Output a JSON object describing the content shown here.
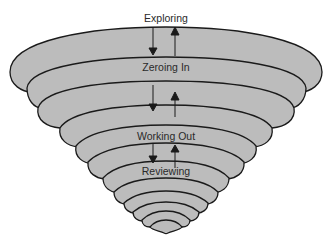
{
  "diagram": {
    "type": "funnel-vortex",
    "colors": {
      "fill": "#bcbcbc",
      "stroke": "#1a1a1a",
      "background": "#ffffff"
    },
    "stages": [
      {
        "label": "Exploring",
        "x": 166,
        "y": 13
      },
      {
        "label": "Zeroing In",
        "x": 166,
        "y": 62
      },
      {
        "label": "Working Out",
        "x": 166,
        "y": 129
      },
      {
        "label": "Reviewing",
        "x": 166,
        "y": 165
      }
    ],
    "arrows": [
      {
        "direction": "down",
        "x": 153,
        "y1": 27,
        "y2": 55
      },
      {
        "direction": "up",
        "x": 175,
        "y1": 55,
        "y2": 27
      },
      {
        "direction": "down",
        "x": 153,
        "y1": 84,
        "y2": 106
      },
      {
        "direction": "up",
        "x": 175,
        "y1": 116,
        "y2": 92
      },
      {
        "direction": "down",
        "x": 153,
        "y1": 143,
        "y2": 162
      },
      {
        "direction": "up",
        "x": 175,
        "y1": 168,
        "y2": 145
      }
    ]
  }
}
